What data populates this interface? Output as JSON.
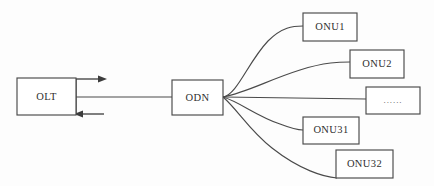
{
  "diagram": {
    "type": "network-topology",
    "background_color": "#fdfdfd",
    "stroke_color": "#4a4a4a",
    "text_color": "#2f2f2f",
    "nodes": [
      {
        "id": "olt",
        "label": "OLT",
        "x": 17,
        "y": 78,
        "w": 59,
        "h": 37
      },
      {
        "id": "odn",
        "label": "ODN",
        "x": 172,
        "y": 80,
        "w": 51,
        "h": 35
      },
      {
        "id": "onu1",
        "label": "ONU1",
        "x": 303,
        "y": 13,
        "w": 54,
        "h": 28
      },
      {
        "id": "onu2",
        "label": "ONU2",
        "x": 350,
        "y": 50,
        "w": 54,
        "h": 28
      },
      {
        "id": "dots",
        "label": "......",
        "x": 366,
        "y": 87,
        "w": 54,
        "h": 27
      },
      {
        "id": "onu31",
        "label": "ONU31",
        "x": 303,
        "y": 117,
        "w": 56,
        "h": 27
      },
      {
        "id": "onu32",
        "label": "ONU32",
        "x": 336,
        "y": 150,
        "w": 57,
        "h": 28
      }
    ],
    "links": [
      {
        "id": "olt-odn-trunk",
        "from": "olt",
        "to": "odn",
        "style": "straight"
      },
      {
        "id": "odn-onu1",
        "from": "odn",
        "to": "onu1",
        "style": "curve"
      },
      {
        "id": "odn-onu2",
        "from": "odn",
        "to": "onu2",
        "style": "curve"
      },
      {
        "id": "odn-dots",
        "from": "odn",
        "to": "dots",
        "style": "straight"
      },
      {
        "id": "odn-onu31",
        "from": "odn",
        "to": "onu31",
        "style": "curve"
      },
      {
        "id": "odn-onu32",
        "from": "odn",
        "to": "onu32",
        "style": "curve"
      }
    ],
    "arrows": [
      {
        "id": "downstream-arrow",
        "direction": "right",
        "y": 79,
        "x_start": 76,
        "x_end": 104
      },
      {
        "id": "upstream-arrow",
        "direction": "left",
        "y": 114,
        "x_start": 104,
        "x_end": 76
      }
    ]
  }
}
